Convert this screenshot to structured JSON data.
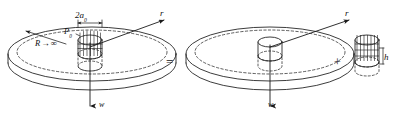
{
  "figure": {
    "kind": "engineering-superposition-diagram",
    "stroke_color": "#1a1a1a",
    "background_color": "#ffffff"
  },
  "left_diagram": {
    "name": "infinite-plate-with-loaded-hub",
    "labels": {
      "diameter": "2a",
      "diameter_subscript": "0",
      "pressure": "P",
      "pressure_subscript": "0",
      "radius": "R",
      "radius_arrow": "→",
      "radius_value": "∞",
      "axis_radial": "r",
      "axis_deflection": "w"
    }
  },
  "operators": {
    "equals": "=",
    "plus": "+"
  },
  "right_diagram": {
    "name": "infinite-plate-plain-hub",
    "labels": {
      "axis_radial": "r",
      "axis_deflection": "w"
    }
  },
  "detail_diagram": {
    "name": "isolated-hub-cylinder",
    "labels": {
      "height": "h"
    }
  }
}
